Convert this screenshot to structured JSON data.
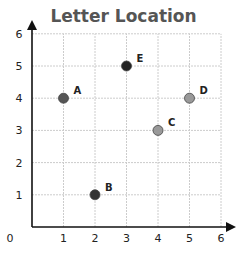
{
  "chart_data": {
    "type": "scatter",
    "title": "Letter Location",
    "xlabel": "",
    "ylabel": "",
    "xlim": [
      0,
      6
    ],
    "ylim": [
      0,
      6
    ],
    "grid": true,
    "x_ticks": [
      "0",
      "1",
      "2",
      "3",
      "4",
      "5",
      "6"
    ],
    "y_ticks": [
      "1",
      "2",
      "3",
      "4",
      "5",
      "6"
    ],
    "points": [
      {
        "label": "A",
        "x": 1,
        "y": 4,
        "color": "#555555"
      },
      {
        "label": "B",
        "x": 2,
        "y": 1,
        "color": "#333333"
      },
      {
        "label": "C",
        "x": 4,
        "y": 3,
        "color": "#999999"
      },
      {
        "label": "D",
        "x": 5,
        "y": 4,
        "color": "#999999"
      },
      {
        "label": "E",
        "x": 3,
        "y": 5,
        "color": "#222222"
      }
    ]
  }
}
